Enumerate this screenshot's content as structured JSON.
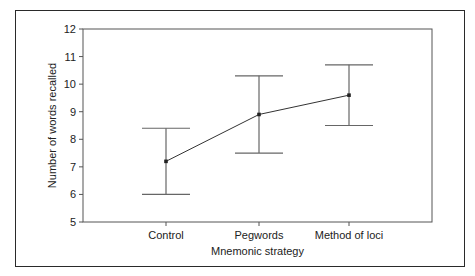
{
  "chart_data": {
    "type": "line",
    "title": "",
    "xlabel": "Mnemonic strategy",
    "ylabel": "Number of words recalled",
    "categories": [
      "Control",
      "Pegwords",
      "Method of loci"
    ],
    "series": [
      {
        "name": "Mean words recalled",
        "values": [
          7.2,
          8.9,
          9.6
        ],
        "error_upper": [
          8.4,
          10.3,
          10.7
        ],
        "error_lower": [
          6.0,
          7.5,
          8.5
        ]
      }
    ],
    "ylim": [
      5,
      12
    ],
    "yticks": [
      5,
      6,
      7,
      8,
      9,
      10,
      11,
      12
    ],
    "grid": false,
    "legend": "none",
    "colors": {
      "line": "#333333",
      "errorbar": "#666666",
      "axis": "#555555"
    }
  }
}
